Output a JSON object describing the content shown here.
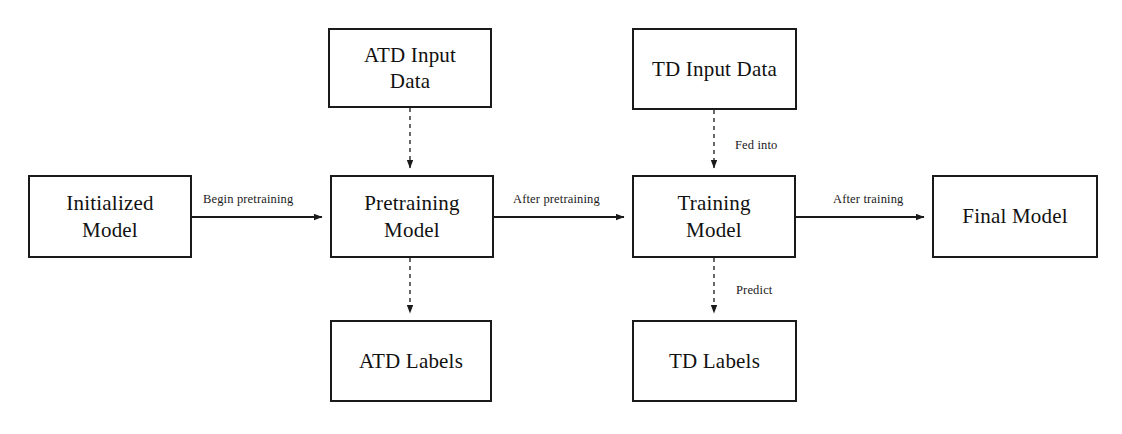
{
  "diagram": {
    "canvas": {
      "width": 1122,
      "height": 434
    },
    "colors": {
      "stroke": "#1a1a1a",
      "background": "#ffffff",
      "text": "#111111"
    },
    "nodes": [
      {
        "id": "initialized-model",
        "label": "Initialized\nModel",
        "x": 28,
        "y": 175,
        "w": 164,
        "h": 83,
        "font_size": 21
      },
      {
        "id": "atd-input-data",
        "label": "ATD Input\nData",
        "x": 328,
        "y": 28,
        "w": 164,
        "h": 80,
        "font_size": 21
      },
      {
        "id": "td-input-data",
        "label": "TD Input Data",
        "x": 632,
        "y": 28,
        "w": 165,
        "h": 82,
        "font_size": 21
      },
      {
        "id": "pretraining-model",
        "label": "Pretraining\nModel",
        "x": 330,
        "y": 175,
        "w": 164,
        "h": 83,
        "font_size": 21
      },
      {
        "id": "training-model",
        "label": "Training\nModel",
        "x": 632,
        "y": 175,
        "w": 164,
        "h": 83,
        "font_size": 21
      },
      {
        "id": "final-model",
        "label": "Final Model",
        "x": 932,
        "y": 175,
        "w": 166,
        "h": 83,
        "font_size": 21
      },
      {
        "id": "atd-labels",
        "label": "ATD Labels",
        "x": 330,
        "y": 320,
        "w": 162,
        "h": 82,
        "font_size": 21
      },
      {
        "id": "td-labels",
        "label": "TD Labels",
        "x": 632,
        "y": 320,
        "w": 165,
        "h": 82,
        "font_size": 21
      }
    ],
    "edges": [
      {
        "id": "initialized-to-pretraining",
        "label": "Begin pretraining",
        "style": "solid",
        "label_x": 203,
        "label_y": 192,
        "from": "initialized-model",
        "to": "pretraining-model"
      },
      {
        "id": "pretraining-to-training",
        "label": "After pretraining",
        "style": "solid",
        "label_x": 513,
        "label_y": 192,
        "from": "pretraining-model",
        "to": "training-model"
      },
      {
        "id": "training-to-final",
        "label": "After training",
        "style": "solid",
        "label_x": 833,
        "label_y": 192,
        "from": "training-model",
        "to": "final-model"
      },
      {
        "id": "atd-input-to-pretraining",
        "label": "",
        "style": "dashed",
        "from": "atd-input-data",
        "to": "pretraining-model"
      },
      {
        "id": "td-input-to-training",
        "label": "Fed into",
        "style": "dashed",
        "label_x": 735,
        "label_y": 138,
        "from": "td-input-data",
        "to": "training-model"
      },
      {
        "id": "pretraining-to-atd-labels",
        "label": "",
        "style": "dashed",
        "from": "pretraining-model",
        "to": "atd-labels"
      },
      {
        "id": "training-to-td-labels",
        "label": "Predict",
        "style": "dashed",
        "label_x": 736,
        "label_y": 283,
        "from": "training-model",
        "to": "td-labels"
      }
    ]
  }
}
